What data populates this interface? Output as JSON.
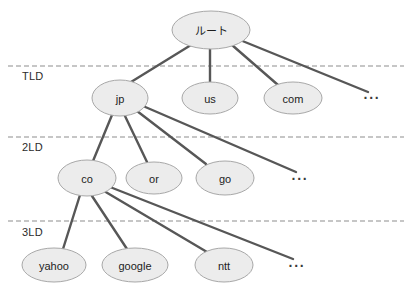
{
  "diagram": {
    "type": "tree-diagram",
    "background_color": "#ffffff",
    "node_fill_color": "#ececec",
    "node_stroke_color": "#a8a8a8",
    "edge_color": "#575757",
    "divider_color": "#8d8d8d",
    "levels": [
      {
        "id": "tld",
        "label": "TLD",
        "label_x": 22,
        "label_y": 80,
        "divider_y": 66
      },
      {
        "id": "2ld",
        "label": "2LD",
        "label_x": 22,
        "label_y": 151,
        "divider_y": 137
      },
      {
        "id": "3ld",
        "label": "3LD",
        "label_x": 22,
        "label_y": 236,
        "divider_y": 221
      }
    ],
    "nodes": [
      {
        "id": "root",
        "label": "ルート",
        "cx": 211,
        "cy": 30,
        "rx": 39,
        "ry": 19
      },
      {
        "id": "jp",
        "label": "jp",
        "cx": 120,
        "cy": 98,
        "rx": 28,
        "ry": 18
      },
      {
        "id": "us",
        "label": "us",
        "cx": 210,
        "cy": 98,
        "rx": 28,
        "ry": 16
      },
      {
        "id": "com",
        "label": "com",
        "cx": 293,
        "cy": 98,
        "rx": 29,
        "ry": 16
      },
      {
        "id": "co",
        "label": "co",
        "cx": 87,
        "cy": 178,
        "rx": 29,
        "ry": 18
      },
      {
        "id": "or",
        "label": "or",
        "cx": 154,
        "cy": 178,
        "rx": 28,
        "ry": 16
      },
      {
        "id": "go",
        "label": "go",
        "cx": 225,
        "cy": 178,
        "rx": 29,
        "ry": 17
      },
      {
        "id": "yahoo",
        "label": "yahoo",
        "cx": 54,
        "cy": 265,
        "rx": 32,
        "ry": 17
      },
      {
        "id": "google",
        "label": "google",
        "cx": 135,
        "cy": 265,
        "rx": 33,
        "ry": 17
      },
      {
        "id": "ntt",
        "label": "ntt",
        "cx": 224,
        "cy": 265,
        "rx": 29,
        "ry": 17
      }
    ],
    "ellipses_markers": [
      {
        "id": "tld-more",
        "label": "···",
        "x": 372,
        "y": 98
      },
      {
        "id": "2ld-more",
        "label": "···",
        "x": 300,
        "y": 179
      },
      {
        "id": "3ld-more",
        "label": "···",
        "x": 297,
        "y": 266
      }
    ],
    "edges": [
      {
        "from": "root",
        "to": "jp",
        "x1": 191,
        "y1": 45,
        "x2": 131,
        "y2": 82
      },
      {
        "from": "root",
        "to": "us",
        "x1": 210,
        "y1": 49,
        "x2": 210,
        "y2": 83
      },
      {
        "from": "root",
        "to": "com",
        "x1": 232,
        "y1": 45,
        "x2": 278,
        "y2": 85
      },
      {
        "from": "root",
        "to": "tld-more",
        "x1": 240,
        "y1": 40,
        "x2": 368,
        "y2": 92
      },
      {
        "from": "jp",
        "to": "co",
        "x1": 112,
        "y1": 115,
        "x2": 93,
        "y2": 161
      },
      {
        "from": "jp",
        "to": "or",
        "x1": 125,
        "y1": 116,
        "x2": 147,
        "y2": 162
      },
      {
        "from": "jp",
        "to": "go",
        "x1": 137,
        "y1": 111,
        "x2": 206,
        "y2": 164
      },
      {
        "from": "jp",
        "to": "2ld-more",
        "x1": 143,
        "y1": 106,
        "x2": 296,
        "y2": 172
      },
      {
        "from": "co",
        "to": "yahoo",
        "x1": 80,
        "y1": 195,
        "x2": 63,
        "y2": 249
      },
      {
        "from": "co",
        "to": "google",
        "x1": 92,
        "y1": 196,
        "x2": 127,
        "y2": 249
      },
      {
        "from": "co",
        "to": "ntt",
        "x1": 104,
        "y1": 191,
        "x2": 207,
        "y2": 252
      },
      {
        "from": "co",
        "to": "3ld-more",
        "x1": 110,
        "y1": 187,
        "x2": 293,
        "y2": 259
      }
    ]
  }
}
